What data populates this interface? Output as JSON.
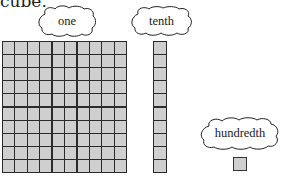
{
  "header": {
    "text": "cube."
  },
  "labels": {
    "one": "one",
    "tenth": "tenth",
    "hundredth": "hundredth"
  },
  "blocks": {
    "one": {
      "rows": 10,
      "cols": 10,
      "represents": "one"
    },
    "tenth": {
      "rows": 10,
      "cols": 1,
      "represents": "tenth"
    },
    "hundredth": {
      "rows": 1,
      "cols": 1,
      "represents": "hundredth"
    }
  },
  "colors": {
    "cell_fill": "#cfcfcf",
    "cell_border": "#2b2b2b",
    "cloud_stroke": "#222222",
    "background": "#ffffff"
  }
}
